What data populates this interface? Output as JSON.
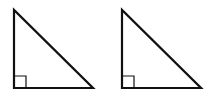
{
  "canvas": {
    "width": 209,
    "height": 110,
    "background": "#ffffff"
  },
  "stroke_color": "#111111",
  "triangles": [
    {
      "name": "left-right-triangle",
      "points": {
        "apex": [
          14,
          10
        ],
        "right_angle": [
          14,
          88
        ],
        "base_end": [
          93,
          88
        ]
      },
      "right_angle_marker_size": 12
    },
    {
      "name": "right-right-triangle",
      "points": {
        "apex": [
          122,
          10
        ],
        "right_angle": [
          122,
          88
        ],
        "base_end": [
          201,
          88
        ]
      },
      "right_angle_marker_size": 12
    }
  ]
}
